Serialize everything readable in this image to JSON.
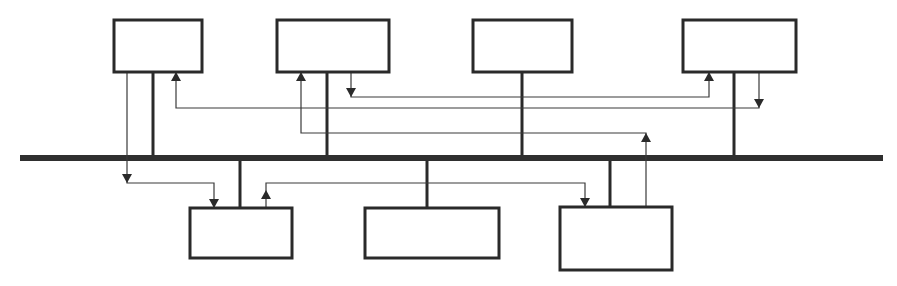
{
  "diagram": {
    "type": "bus-topology",
    "colors": {
      "line": "#2a2a2a",
      "bus": "#2f2f2f",
      "background": "#ffffff"
    },
    "bus": {
      "y": 158,
      "x1": 20,
      "x2": 883
    },
    "nodes": [
      {
        "id": "node-top-1",
        "position": "top",
        "x": 114,
        "y": 20,
        "w": 88,
        "h": 52,
        "stem_x": 153
      },
      {
        "id": "node-top-2",
        "position": "top",
        "x": 277,
        "y": 20,
        "w": 112,
        "h": 52,
        "stem_x": 327
      },
      {
        "id": "node-top-3",
        "position": "top",
        "x": 473,
        "y": 20,
        "w": 99,
        "h": 52,
        "stem_x": 522
      },
      {
        "id": "node-top-4",
        "position": "top",
        "x": 683,
        "y": 20,
        "w": 113,
        "h": 52,
        "stem_x": 734
      },
      {
        "id": "node-bottom-1",
        "position": "bottom",
        "x": 190,
        "y": 208,
        "w": 102,
        "h": 50,
        "stem_x": 240
      },
      {
        "id": "node-bottom-2",
        "position": "bottom",
        "x": 365,
        "y": 208,
        "w": 134,
        "h": 50,
        "stem_x": 427
      },
      {
        "id": "node-bottom-3",
        "position": "bottom",
        "x": 560,
        "y": 207,
        "w": 112,
        "h": 63,
        "stem_x": 610
      }
    ],
    "signals": [
      {
        "id": "signal-top1-to-bottom1",
        "from": "node-top-1",
        "to": "node-bottom-1",
        "points": [
          [
            127,
            72
          ],
          [
            127,
            183
          ],
          [
            214,
            183
          ],
          [
            214,
            208
          ]
        ],
        "arrows": [
          {
            "x": 127,
            "y": 183,
            "dir": "down"
          },
          {
            "x": 214,
            "y": 208,
            "dir": "down"
          }
        ]
      },
      {
        "id": "signal-top4-to-top1",
        "from": "node-top-4",
        "to": "node-top-1",
        "points": [
          [
            759,
            72
          ],
          [
            759,
            108
          ],
          [
            176,
            108
          ],
          [
            176,
            72
          ]
        ],
        "arrows": [
          {
            "x": 759,
            "y": 108,
            "dir": "down"
          },
          {
            "x": 176,
            "y": 72,
            "dir": "up"
          }
        ]
      },
      {
        "id": "signal-top2-to-top4",
        "from": "node-top-2",
        "to": "node-top-4",
        "points": [
          [
            351,
            72
          ],
          [
            351,
            97
          ],
          [
            709,
            97
          ],
          [
            709,
            72
          ]
        ],
        "arrows": [
          {
            "x": 351,
            "y": 97,
            "dir": "down"
          },
          {
            "x": 709,
            "y": 72,
            "dir": "up"
          }
        ]
      },
      {
        "id": "signal-bottom3-to-top2",
        "from": "node-bottom-3",
        "to": "node-top-2",
        "points": [
          [
            646,
            207
          ],
          [
            646,
            133
          ],
          [
            301,
            133
          ],
          [
            301,
            72
          ]
        ],
        "arrows": [
          {
            "x": 646,
            "y": 133,
            "dir": "up"
          },
          {
            "x": 301,
            "y": 72,
            "dir": "up"
          }
        ]
      },
      {
        "id": "signal-bottom1-to-bottom3",
        "from": "node-bottom-1",
        "to": "node-bottom-3",
        "points": [
          [
            266,
            208
          ],
          [
            266,
            183
          ],
          [
            585,
            183
          ],
          [
            585,
            207
          ]
        ],
        "arrows": [
          {
            "x": 266,
            "y": 190,
            "dir": "up"
          },
          {
            "x": 585,
            "y": 207,
            "dir": "down"
          }
        ]
      }
    ]
  }
}
